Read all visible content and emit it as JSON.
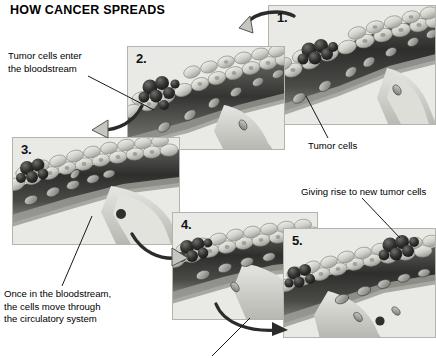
{
  "title": "HOW CANCER SPREADS",
  "panels": [
    {
      "num": "1."
    },
    {
      "num": "2."
    },
    {
      "num": "3."
    },
    {
      "num": "4."
    },
    {
      "num": "5."
    }
  ],
  "captions": {
    "tumor_cells_enter": "Tumor cells enter\nthe bloodstream",
    "tumor_cells": "Tumor cells",
    "once_in_bloodstream": "Once in the bloodstream,\nthe cells move through\nthe circulatory system",
    "giving_rise": "Giving rise to new tumor cells",
    "bottom_clipped": ""
  },
  "colors": {
    "page_background": "#ffffff",
    "panel_background": "#e9e9e6",
    "panel_border": "#b4b4ae",
    "text": "#000000",
    "tumor_dark": "#2b2b2b",
    "vessel_lumen": "#3a3a3a",
    "endothelium": "#c9c9c4",
    "arrow_fill": "#c6c6c1"
  }
}
